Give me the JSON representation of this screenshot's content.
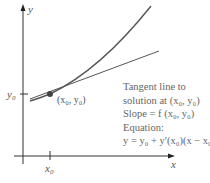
{
  "diagram": {
    "axes": {
      "x_label": "x",
      "y_label": "y",
      "x_tick_label": "x",
      "x_tick_sub": "0",
      "y_tick_label": "y",
      "y_tick_sub": "0"
    },
    "point_label": "(x₀, y₀)",
    "caption": {
      "line1": "Tangent line to",
      "line2": "solution at (x₀, y₀)",
      "line3": "Slope = f (x₀, y₀)",
      "line4": "Equation:",
      "line5": "y = y₀ + y′(x₀)(x − x₀)"
    },
    "colors": {
      "axis": "#333333",
      "curve": "#555555",
      "tangent": "#555555",
      "point": "#444444",
      "text": "#666666"
    }
  }
}
